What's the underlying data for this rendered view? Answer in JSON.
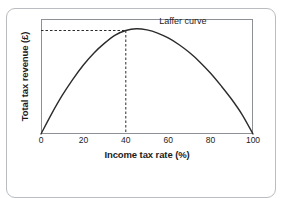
{
  "chart_data": {
    "type": "line",
    "title": "",
    "xlabel": "Income tax rate (%)",
    "ylabel": "Total tax revenue (£)",
    "xlim": [
      0,
      100
    ],
    "ylim": [
      0,
      1
    ],
    "xticks": [
      0,
      20,
      40,
      60,
      80,
      100
    ],
    "xticklabels": [
      "0",
      "20",
      "40",
      "60",
      "80",
      "100"
    ],
    "yticks": [],
    "yticklabels": [],
    "grid": false,
    "legend_position": "inline-annotation",
    "series": [
      {
        "name": "Laffer curve",
        "color": "#2b2b2b",
        "x": [
          0,
          5,
          10,
          15,
          20,
          25,
          30,
          35,
          40,
          45,
          50,
          55,
          60,
          65,
          70,
          75,
          80,
          85,
          90,
          95,
          100
        ],
        "y": [
          0.0,
          0.175,
          0.335,
          0.475,
          0.6,
          0.705,
          0.79,
          0.86,
          0.9,
          0.915,
          0.905,
          0.878,
          0.835,
          0.778,
          0.708,
          0.625,
          0.528,
          0.418,
          0.3,
          0.165,
          0.0
        ]
      }
    ],
    "annotations": [
      {
        "name": "laffer-curve-label",
        "text": "Laffer curve",
        "x": 68,
        "y": 0.9
      }
    ],
    "guides": [
      {
        "name": "peak-vertical-dashed-line",
        "orientation": "vertical",
        "value": 40,
        "style": "dashed"
      },
      {
        "name": "peak-horizontal-dashed-line",
        "orientation": "horizontal",
        "value": 0.9,
        "style": "dashed"
      }
    ],
    "peak": {
      "x": 40,
      "y": 0.9,
      "note": "revenue-maximising tax rate"
    }
  }
}
